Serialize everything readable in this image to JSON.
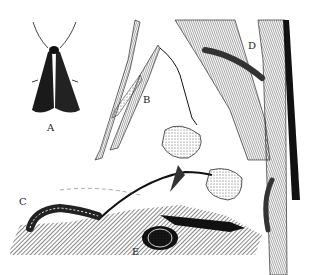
{
  "illustration": {
    "style": "black-and-white pen-and-ink scientific illustration",
    "background": "#ffffff",
    "ink": "#111111",
    "labels": [
      {
        "id": "A",
        "text": "A",
        "x": 47,
        "y": 122,
        "subject": "adult moth, wings folded, dorsal view"
      },
      {
        "id": "B",
        "text": "B",
        "x": 143,
        "y": 94,
        "subject": "egg mass on grass blade"
      },
      {
        "id": "C",
        "text": "C",
        "x": 19,
        "y": 196,
        "subject": "larva (caterpillar) on soil surface"
      },
      {
        "id": "D",
        "text": "D",
        "x": 248,
        "y": 40,
        "subject": "larva feeding on corn leaf and stalk"
      },
      {
        "id": "E",
        "text": "E",
        "x": 132,
        "y": 246,
        "subject": "pupa in earthen cell underground"
      }
    ]
  }
}
